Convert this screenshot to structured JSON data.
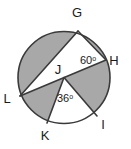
{
  "figure": {
    "type": "circle-geometry-diagram",
    "background_color": "#ffffff",
    "shade_color": "#a8a8a8",
    "line_color": "#3a3a3a",
    "label_color": "#1a1a1a",
    "circle": {
      "center_label": "J",
      "center_x": 64,
      "center_y": 77.5,
      "radius": 46
    },
    "points": [
      {
        "id": "G",
        "label": "G",
        "x": 78,
        "y": 31,
        "label_x": 77,
        "label_y": 17
      },
      {
        "id": "H",
        "label": "H",
        "x": 106,
        "y": 60,
        "label_x": 114,
        "label_y": 65
      },
      {
        "id": "I",
        "label": "I",
        "x": 97,
        "y": 116,
        "label_x": 103,
        "label_y": 129
      },
      {
        "id": "K",
        "label": "K",
        "x": 47,
        "y": 123,
        "label_x": 45,
        "label_y": 140
      },
      {
        "id": "L",
        "label": "L",
        "x": 20,
        "y": 96,
        "label_x": 7,
        "label_y": 103
      },
      {
        "id": "J",
        "label": "J",
        "x": 64,
        "y": 77.5,
        "label_x": 58,
        "label_y": 74
      }
    ],
    "chords": [
      {
        "name": "chord-G-L",
        "from": "G",
        "to": "L"
      },
      {
        "name": "chord-G-H",
        "from": "G",
        "to": "H"
      },
      {
        "name": "chord-H-L",
        "from": "H",
        "to": "L"
      },
      {
        "name": "segment-J-K",
        "from": "J",
        "to": "K"
      },
      {
        "name": "segment-J-I",
        "from": "J",
        "to": "I"
      }
    ],
    "angles": [
      {
        "name": "angle-at-H",
        "text": "60",
        "unit": "o",
        "value": 60,
        "x": 80,
        "y": 64
      },
      {
        "name": "angle-at-J",
        "text": "36",
        "unit": "o",
        "value": 36,
        "x": 57,
        "y": 102
      }
    ],
    "shaded_regions": [
      {
        "name": "shaded-major-segment-G-L",
        "description": "major segment left of chord GL"
      },
      {
        "name": "shaded-minor-segment-G-H",
        "description": "minor segment right of chord GH"
      },
      {
        "name": "shaded-sector-H-J-I",
        "description": "region bounded by JH, arc HI, IJ"
      },
      {
        "name": "shaded-sector-L-J-K",
        "description": "region bounded by JL, arc LK, KJ"
      }
    ]
  }
}
